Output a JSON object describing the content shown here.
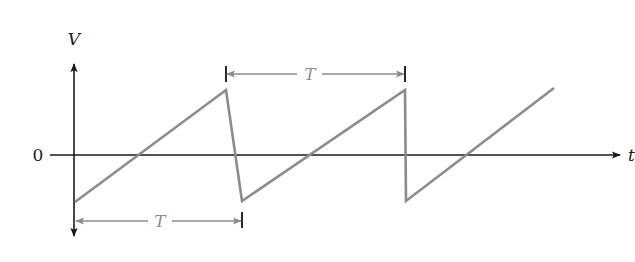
{
  "diagram": {
    "type": "sawtooth-waveform",
    "y_axis_label": "V",
    "x_axis_label": "t",
    "origin_label": "0",
    "period_label_top": "T",
    "period_label_bottom": "T",
    "colors": {
      "axis": "#1a1a1a",
      "waveform": "#8c8c8c",
      "dimension": "#8c8c8c",
      "background": "#ffffff"
    },
    "waveform_points": [
      [
        75,
        202
      ],
      [
        226,
        90
      ],
      [
        242,
        201
      ],
      [
        405,
        90
      ],
      [
        406,
        201
      ],
      [
        554,
        88
      ]
    ]
  }
}
